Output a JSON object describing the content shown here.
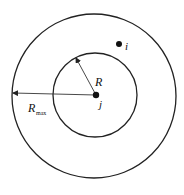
{
  "diagram": {
    "outer_circle": {
      "cx": 94,
      "cy": 96,
      "r": 82,
      "label": "R",
      "label_sub": "max"
    },
    "inner_circle": {
      "cx": 95,
      "cy": 95,
      "r": 42,
      "label": "R"
    },
    "points": [
      {
        "id": "j",
        "label": "j",
        "cx": 96,
        "cy": 95
      },
      {
        "id": "i",
        "label": "i",
        "cx": 119,
        "cy": 44
      }
    ],
    "stroke_color": "#222222",
    "background": "#ffffff"
  }
}
